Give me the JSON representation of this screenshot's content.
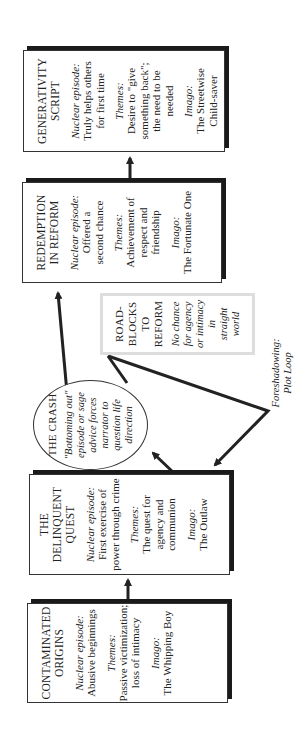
{
  "diagram": {
    "orientation": "rotated 90 degrees counter-clockwise",
    "nodes": {
      "contaminated_origins": {
        "title_l1": "CONTAMINATED",
        "title_l2": "ORIGINS",
        "episode_label": "Nuclear episode:",
        "episode_l1": "Abusive beginnings",
        "themes_label": "Themes:",
        "themes_l1": "Passive victimization;",
        "themes_l2": "loss of intimacy",
        "imago_label": "Imago:",
        "imago_l1": "The Whipping Boy"
      },
      "delinquent_quest": {
        "title_l1": "THE",
        "title_l2": "DELINQUENT",
        "title_l3": "QUEST",
        "episode_label": "Nuclear episode:",
        "episode_l1": "First exercise of",
        "episode_l2": "power through crime",
        "themes_label": "Themes:",
        "themes_l1": "The quest for",
        "themes_l2": "agency and",
        "themes_l3": "communion",
        "imago_label": "Imago:",
        "imago_l1": "The Outlaw"
      },
      "the_crash": {
        "title": "THE CRASH",
        "l1": "\"Bottoming out\"",
        "l2": "episode or sage",
        "l3": "advice forces",
        "l4": "narrator to",
        "l5": "question life",
        "l6": "direction"
      },
      "roadblocks": {
        "title_l1": "ROAD-",
        "title_l2": "BLOCKS",
        "title_l3": "TO",
        "title_l4": "REFORM",
        "l1": "No chance",
        "l2": "for agency",
        "l3": "or intimacy",
        "l4": "in",
        "l5": "straight",
        "l6": "world"
      },
      "redemption": {
        "title_l1": "REDEMPTION",
        "title_l2": "IN REFORM",
        "episode_label": "Nuclear episode:",
        "episode_l1": "Offered a",
        "episode_l2": "second chance",
        "themes_label": "Themes:",
        "themes_l1": "Achievement of",
        "themes_l2": "respect and",
        "themes_l3": "friendship",
        "imago_label": "Imago:",
        "imago_l1": "The Fortunate One"
      },
      "generativity": {
        "title_l1": "GENERATIVITY",
        "title_l2": "SCRIPT",
        "episode_label": "Nuclear episode:",
        "episode_l1": "Truly helps others",
        "episode_l2": "for first time",
        "themes_label": "Themes:",
        "themes_l1": "Desire to \"give",
        "themes_l2": "something back\";",
        "themes_l3": "the need to be",
        "themes_l4": "needed",
        "imago_label": "Imago:",
        "imago_l1": "The Streetwise",
        "imago_l2": "Child-saver"
      }
    },
    "annotation": {
      "l1": "Foreshadowing:",
      "l2": "Plot Loop"
    },
    "colors": {
      "box_border": "#333333",
      "box_shadow": "#1a1a1a",
      "roadblock_border": "#dddddd",
      "arrow": "#222222"
    }
  }
}
